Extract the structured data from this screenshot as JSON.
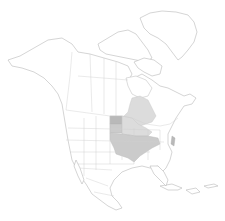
{
  "map": {
    "region": "North America",
    "type": "species-range-map",
    "colors": {
      "background": "#ffffff",
      "land": "#ffffff",
      "outline": "#b8b8b8",
      "range_dark": "#b9b9b9",
      "range_mid": "#cbcbcb",
      "range_light": "#dcdcdc"
    },
    "highlighted_areas": [
      {
        "name": "north-dakota",
        "shade": "dark"
      },
      {
        "name": "south-dakota",
        "shade": "mid"
      },
      {
        "name": "central-us-midwest",
        "shade": "mid"
      },
      {
        "name": "ontario-great-lakes",
        "shade": "light"
      },
      {
        "name": "new-jersey-coast",
        "shade": "dark"
      }
    ]
  }
}
